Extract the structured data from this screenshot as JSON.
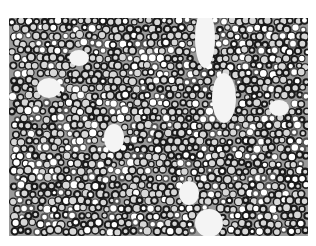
{
  "image": {
    "subject": "cell-culture-micrograph",
    "colors": {
      "background": "#ffffff",
      "cell_membrane": "#1a1a1a",
      "cell_interior": "#d8d8d8",
      "gap": "#f4f4f4"
    },
    "frame": {
      "x": 9,
      "y": 18,
      "width": 299,
      "height": 218
    },
    "gaps": [
      {
        "cx": 196,
        "cy": 20,
        "rx": 10,
        "ry": 30
      },
      {
        "cx": 215,
        "cy": 80,
        "rx": 12,
        "ry": 25
      },
      {
        "cx": 105,
        "cy": 120,
        "rx": 10,
        "ry": 14
      },
      {
        "cx": 40,
        "cy": 70,
        "rx": 12,
        "ry": 10
      },
      {
        "cx": 180,
        "cy": 175,
        "rx": 10,
        "ry": 12
      },
      {
        "cx": 200,
        "cy": 205,
        "rx": 14,
        "ry": 14
      },
      {
        "cx": 270,
        "cy": 90,
        "rx": 10,
        "ry": 8
      },
      {
        "cx": 70,
        "cy": 40,
        "rx": 10,
        "ry": 8
      }
    ],
    "seed": 7
  }
}
